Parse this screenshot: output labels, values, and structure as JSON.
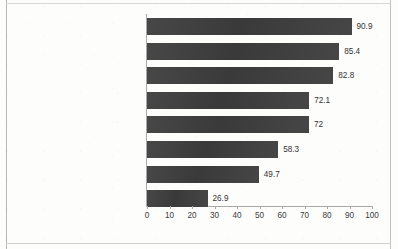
{
  "chart_data": {
    "type": "bar",
    "orientation": "horizontal",
    "title": "",
    "subtitle": "",
    "xlabel": "",
    "ylabel": "",
    "xlim": [
      0,
      100
    ],
    "xticks": [
      0,
      10,
      20,
      30,
      40,
      50,
      60,
      70,
      80,
      90,
      100
    ],
    "xtick_labels": [
      "0",
      "10",
      "20",
      "30",
      "40",
      "50",
      "60",
      "70",
      "80",
      "90",
      "100"
    ],
    "grid": false,
    "legend": null,
    "bar_color": "#3c3c3c",
    "categories": [
      "Email users",
      "Search users",
      "Digital video viewers",
      "Digital audio listeners",
      "Social network users",
      "Digital gamers",
      "Smartphone messaging app users",
      "Podcast listeners"
    ],
    "values": [
      90.9,
      85.4,
      82.8,
      72.1,
      72,
      58.3,
      49.7,
      26.9
    ],
    "value_labels": [
      "90.9",
      "85.4",
      "82.8",
      "72.1",
      "72",
      "58.3",
      "49.7",
      "26.9"
    ]
  }
}
